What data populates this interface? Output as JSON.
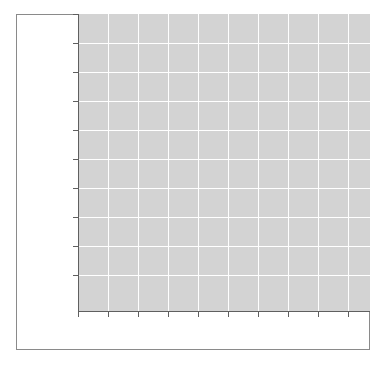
{
  "figure": {
    "width": 387,
    "height": 366,
    "background_color": "#ffffff",
    "border_color": "#8a8a8a",
    "title": "",
    "has_visible_text": false
  },
  "axes": {
    "facecolor": "#d3d3d3",
    "grid_color": "#ffffff",
    "spine_color": "#5f5f5f",
    "tick_color": "#5f5f5f",
    "left_px": 78,
    "top_px": 14,
    "width_px": 292,
    "height_px": 297,
    "grid_visible": true,
    "top_spine_visible": false,
    "right_spine_visible": false
  },
  "chart_data": {
    "type": "line",
    "title": "",
    "subtitle": "",
    "xlabel": "",
    "ylabel": "",
    "annotations": [],
    "legend": {
      "visible": false,
      "position": "none",
      "entries": []
    },
    "grid": true,
    "x": [],
    "categories": [],
    "values": [],
    "series": [],
    "xlim": [
      0,
      10
    ],
    "ylim": [
      0,
      10
    ],
    "xticks": [
      0,
      1,
      2,
      3,
      4,
      5,
      6,
      7,
      8,
      9
    ],
    "yticks": [
      0,
      1,
      2,
      3,
      4,
      5,
      6,
      7,
      8,
      9
    ],
    "xtick_labels": [
      "",
      "",
      "",
      "",
      "",
      "",
      "",
      "",
      "",
      ""
    ],
    "ytick_labels": [
      "",
      "",
      "",
      "",
      "",
      "",
      "",
      "",
      "",
      ""
    ],
    "xtick_positions_px": [
      78,
      108,
      138,
      168,
      198,
      228,
      258,
      288,
      318,
      348
    ],
    "ytick_positions_px": [
      14,
      43,
      72,
      101,
      130,
      159,
      188,
      217,
      246,
      275
    ],
    "vertical_gridlines_px": [
      108,
      138,
      168,
      198,
      228,
      258,
      288,
      318,
      348
    ],
    "horizontal_gridlines_px": [
      43,
      72,
      101,
      130,
      159,
      188,
      217,
      246,
      275
    ],
    "note": "Empty axes: no data series plotted, no tick labels, no title or axis labels rendered."
  }
}
